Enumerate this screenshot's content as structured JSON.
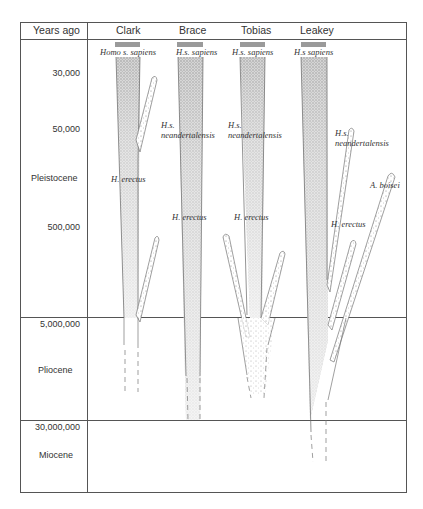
{
  "header": {
    "axis_label": "Years ago",
    "columns": [
      "Clark",
      "Brace",
      "Tobias",
      "Leakey"
    ]
  },
  "time_axis": {
    "ticks": [
      "30,000",
      "50,000",
      "500,000",
      "5,000,000",
      "30,000,000"
    ],
    "epochs": [
      "Pleistocene",
      "Pliocene",
      "Miocene"
    ]
  },
  "species_labels": {
    "clark": {
      "sapiens": "Homo s. sapiens",
      "erectus": "H. erectus"
    },
    "brace": {
      "sapiens": "H.s. sapiens",
      "neander_1": "H.s.",
      "neander_2": "neandertalensis",
      "erectus": "H. erectus"
    },
    "tobias": {
      "sapiens": "H.s. sapiens",
      "neander_1": "H.s.",
      "neander_2": "neandertalensis",
      "erectus": "H. erectus"
    },
    "leakey": {
      "sapiens": "H.s sapiens",
      "neander_1": "H.s.",
      "neander_2": "neandertalensis",
      "erectus": "H. erectus",
      "boisei": "A. boisei"
    }
  },
  "colors": {
    "line": "#555555",
    "bar": "#9a9a9a",
    "stipple": "#8a8a8a"
  }
}
